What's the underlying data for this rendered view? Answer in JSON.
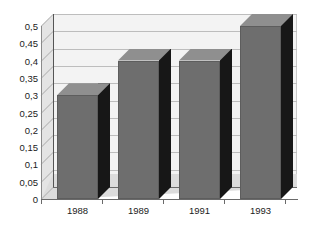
{
  "chart_data": {
    "type": "bar",
    "title": "",
    "subtitle": "",
    "xlabel": "",
    "ylabel": "",
    "categories": [
      "1988",
      "1989",
      "1991",
      "1993"
    ],
    "values": [
      0.3,
      0.4,
      0.4,
      0.5
    ],
    "value_labels": [
      "0,3",
      "0,4",
      "0,4",
      "0,5"
    ],
    "ylim": [
      0,
      0.5
    ],
    "ytick_values": [
      0,
      0.05,
      0.1,
      0.15,
      0.2,
      0.25,
      0.3,
      0.35,
      0.4,
      0.45,
      0.5
    ],
    "ytick_labels": [
      "0",
      "0,05",
      "0,1",
      "0,15",
      "0,2",
      "0,25",
      "0,3",
      "0,35",
      "0,4",
      "0,45",
      "0,5"
    ],
    "decimal_separator": ",",
    "grid": true,
    "grid_axis": "y",
    "legend": false,
    "legend_position": "none",
    "style": "3d-column",
    "series": [
      {
        "name": "",
        "values": [
          0.3,
          0.4,
          0.4,
          0.5
        ]
      }
    ],
    "colors": {
      "bar_front": "#6e6e6e",
      "bar_side": "#171717",
      "bar_top": "#8f8f8f",
      "plot_background": "#f3f3f3",
      "floor": "#dcdcdc",
      "left_wall": "#e4e4e4",
      "gridline": "#bdbdbd",
      "axis": "#6a6a6a",
      "text": "#1b1b1b",
      "page_background": "#ffffff"
    }
  },
  "axes": {
    "y": {
      "ticks": [
        {
          "label": "0,5",
          "value": 0.5
        },
        {
          "label": "0,45",
          "value": 0.45
        },
        {
          "label": "0,4",
          "value": 0.4
        },
        {
          "label": "0,35",
          "value": 0.35
        },
        {
          "label": "0,3",
          "value": 0.3
        },
        {
          "label": "0,25",
          "value": 0.25
        },
        {
          "label": "0,2",
          "value": 0.2
        },
        {
          "label": "0,15",
          "value": 0.15
        },
        {
          "label": "0,1",
          "value": 0.1
        },
        {
          "label": "0,05",
          "value": 0.05
        },
        {
          "label": "0",
          "value": 0
        }
      ]
    },
    "x": {
      "ticks": [
        {
          "label": "1988"
        },
        {
          "label": "1989"
        },
        {
          "label": "1991"
        },
        {
          "label": "1993"
        }
      ]
    }
  }
}
